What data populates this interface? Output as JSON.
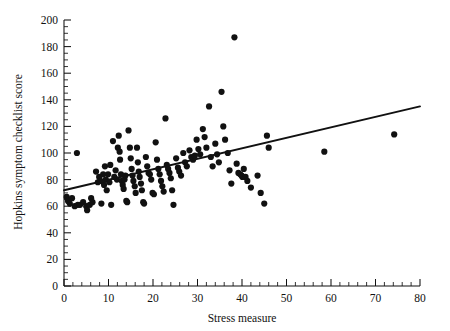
{
  "chart_data": {
    "type": "scatter",
    "title": "",
    "xlabel": "Stress measure",
    "ylabel": "Hopkins symptom checklist score",
    "xlim": [
      0,
      80
    ],
    "ylim": [
      0,
      200
    ],
    "xticks": [
      0,
      10,
      20,
      30,
      40,
      50,
      60,
      70,
      80
    ],
    "xtick_labels": [
      "0",
      "10",
      "20",
      "30",
      "40",
      "50",
      "60",
      "70",
      "80"
    ],
    "x_minor_tick_step": 2,
    "yticks": [
      0,
      20,
      40,
      60,
      80,
      100,
      120,
      140,
      160,
      180,
      200
    ],
    "ytick_labels": [
      "0",
      "20",
      "40",
      "60",
      "80",
      "100",
      "120",
      "140",
      "160",
      "180",
      "200"
    ],
    "y_minor_tick_step": 5,
    "grid": false,
    "legend": null,
    "marker_color": "#111111",
    "marker_size_px": 3.1,
    "trendline": {
      "name": "least-squares regression line",
      "color": "#111111",
      "x": [
        0,
        80
      ],
      "y": [
        72,
        135
      ]
    },
    "points": [
      [
        0.6,
        67
      ],
      [
        0.9,
        64
      ],
      [
        1.3,
        62
      ],
      [
        1.8,
        66
      ],
      [
        2.4,
        60
      ],
      [
        2.9,
        100
      ],
      [
        3.1,
        61
      ],
      [
        3.6,
        61
      ],
      [
        4.3,
        63
      ],
      [
        5.0,
        60
      ],
      [
        5.2,
        57
      ],
      [
        5.8,
        61
      ],
      [
        6.1,
        66
      ],
      [
        6.4,
        63
      ],
      [
        7.2,
        86
      ],
      [
        7.6,
        78
      ],
      [
        7.9,
        82
      ],
      [
        8.2,
        79
      ],
      [
        8.4,
        62
      ],
      [
        8.8,
        84
      ],
      [
        9.0,
        76
      ],
      [
        9.2,
        90
      ],
      [
        9.4,
        80
      ],
      [
        9.6,
        72
      ],
      [
        9.9,
        84
      ],
      [
        10.2,
        78
      ],
      [
        10.4,
        91
      ],
      [
        10.6,
        61
      ],
      [
        11.0,
        109
      ],
      [
        11.3,
        82
      ],
      [
        11.6,
        87
      ],
      [
        11.9,
        80
      ],
      [
        12.1,
        104
      ],
      [
        12.3,
        113
      ],
      [
        12.5,
        101
      ],
      [
        12.6,
        95
      ],
      [
        12.8,
        84
      ],
      [
        13.0,
        79
      ],
      [
        13.2,
        76
      ],
      [
        13.4,
        73
      ],
      [
        13.6,
        80
      ],
      [
        13.8,
        83
      ],
      [
        14.0,
        64
      ],
      [
        14.2,
        63
      ],
      [
        14.5,
        117
      ],
      [
        14.8,
        104
      ],
      [
        15.0,
        96
      ],
      [
        15.2,
        88
      ],
      [
        15.4,
        83
      ],
      [
        15.6,
        79
      ],
      [
        15.9,
        75
      ],
      [
        16.1,
        70
      ],
      [
        16.4,
        104
      ],
      [
        16.6,
        93
      ],
      [
        16.8,
        86
      ],
      [
        17.0,
        82
      ],
      [
        17.3,
        77
      ],
      [
        17.5,
        72
      ],
      [
        17.8,
        63
      ],
      [
        18.0,
        62
      ],
      [
        18.4,
        97
      ],
      [
        18.7,
        90
      ],
      [
        19.0,
        85
      ],
      [
        19.3,
        84
      ],
      [
        19.6,
        80
      ],
      [
        19.9,
        70
      ],
      [
        20.2,
        69
      ],
      [
        20.6,
        108
      ],
      [
        20.9,
        95
      ],
      [
        21.2,
        88
      ],
      [
        21.5,
        84
      ],
      [
        21.8,
        79
      ],
      [
        22.1,
        75
      ],
      [
        22.4,
        71
      ],
      [
        22.8,
        126
      ],
      [
        23.1,
        91
      ],
      [
        23.4,
        88
      ],
      [
        23.7,
        85
      ],
      [
        24.0,
        81
      ],
      [
        24.3,
        72
      ],
      [
        24.6,
        61
      ],
      [
        25.2,
        96
      ],
      [
        25.6,
        89
      ],
      [
        25.9,
        86
      ],
      [
        26.3,
        83
      ],
      [
        26.8,
        100
      ],
      [
        27.2,
        93
      ],
      [
        27.6,
        90
      ],
      [
        28.2,
        102
      ],
      [
        28.6,
        97
      ],
      [
        29.0,
        95
      ],
      [
        29.4,
        98
      ],
      [
        29.8,
        110
      ],
      [
        30.2,
        103
      ],
      [
        30.6,
        99
      ],
      [
        31.2,
        118
      ],
      [
        31.6,
        112
      ],
      [
        32.0,
        104
      ],
      [
        32.6,
        135
      ],
      [
        33.0,
        97
      ],
      [
        33.4,
        90
      ],
      [
        34.0,
        107
      ],
      [
        34.4,
        99
      ],
      [
        34.8,
        93
      ],
      [
        35.4,
        146
      ],
      [
        35.8,
        120
      ],
      [
        36.2,
        110
      ],
      [
        36.8,
        100
      ],
      [
        37.2,
        87
      ],
      [
        37.6,
        77
      ],
      [
        38.3,
        187
      ],
      [
        38.8,
        92
      ],
      [
        39.2,
        85
      ],
      [
        39.6,
        84
      ],
      [
        39.9,
        83
      ],
      [
        40.1,
        82
      ],
      [
        40.4,
        88
      ],
      [
        40.8,
        82
      ],
      [
        41.2,
        79
      ],
      [
        42.0,
        74
      ],
      [
        43.5,
        83
      ],
      [
        44.2,
        70
      ],
      [
        45.0,
        62
      ],
      [
        45.6,
        113
      ],
      [
        46.0,
        104
      ],
      [
        58.5,
        101
      ],
      [
        74.2,
        114
      ]
    ]
  }
}
